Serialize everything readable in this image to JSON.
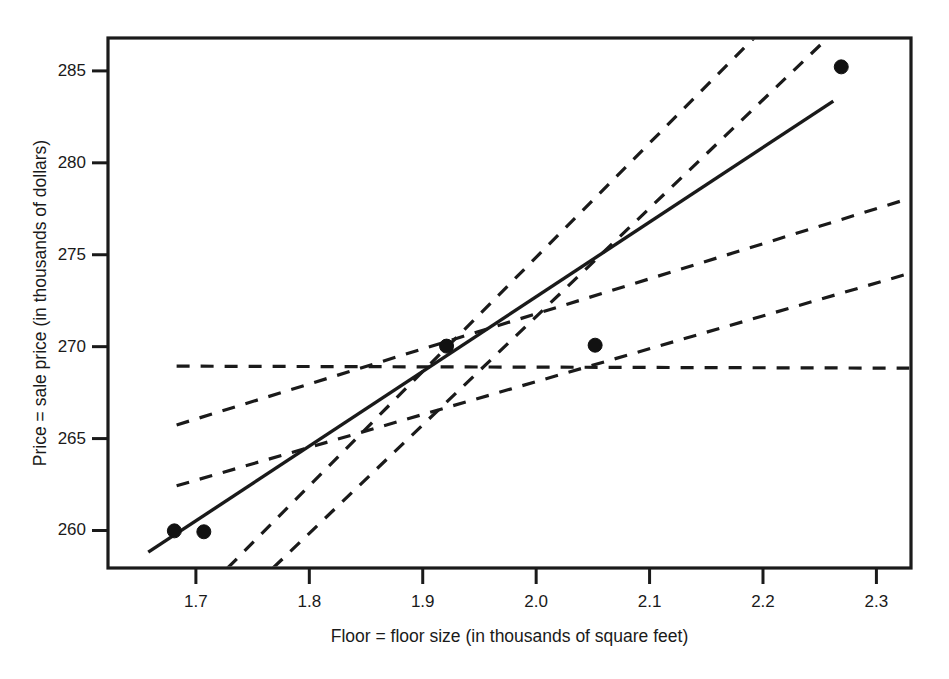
{
  "chart_data": {
    "type": "scatter",
    "title": "",
    "xlabel": "Floor = floor size (in thousands of square feet)",
    "ylabel": "Price = sale price (in thousands of dollars)",
    "xlim": [
      1.6225,
      2.3305
    ],
    "ylim": [
      257.96,
      286.79
    ],
    "xticks": [
      1.7,
      1.8,
      1.9,
      2.0,
      2.1,
      2.2,
      2.3
    ],
    "xtick_labels": [
      "1.7",
      "1.8",
      "1.9",
      "2.0",
      "2.1",
      "2.2",
      "2.3"
    ],
    "yticks": [
      260,
      265,
      270,
      275,
      280,
      285
    ],
    "ytick_labels": [
      "260",
      "265",
      "270",
      "275",
      "280",
      "285"
    ],
    "grid": false,
    "legend": "none",
    "points": [
      {
        "x": 1.681,
        "y": 259.98
      },
      {
        "x": 1.707,
        "y": 259.93
      },
      {
        "x": 1.921,
        "y": 270.03
      },
      {
        "x": 2.052,
        "y": 270.08
      },
      {
        "x": 2.269,
        "y": 285.22
      }
    ],
    "point_color": "#111111",
    "point_radius_px": 7,
    "fitted_line": {
      "name": "least squares regression line",
      "style": "solid",
      "color": "#1a1a1a",
      "x0": 1.658,
      "y0": 258.82,
      "x1": 2.262,
      "y1": 283.36,
      "slope": 40.63,
      "intercept": 191.45
    },
    "candidate_lines": [
      {
        "name": "horizontal candidate line",
        "style": "dashed",
        "color": "#1a1a1a",
        "x0": 1.683,
        "y0": 268.94,
        "x1": 2.33,
        "y1": 268.83,
        "slope": -0.17
      },
      {
        "name": "shallow positive candidate line",
        "style": "dashed",
        "color": "#1a1a1a",
        "x0": 1.683,
        "y0": 265.74,
        "x1": 2.33,
        "y1": 278.08,
        "slope": 19.07
      },
      {
        "name": "moderate positive candidate line",
        "style": "dashed",
        "color": "#1a1a1a",
        "x0": 1.683,
        "y0": 262.43,
        "x1": 2.33,
        "y1": 274.0,
        "slope": 17.88
      },
      {
        "name": "steep candidate line left",
        "style": "dashed",
        "color": "#1a1a1a",
        "x0": 1.728,
        "y0": 257.96,
        "x1": 2.192,
        "y1": 286.79,
        "slope": 62.14
      },
      {
        "name": "steepest candidate line right",
        "style": "dashed",
        "color": "#1a1a1a",
        "x0": 1.768,
        "y0": 257.96,
        "x1": 2.257,
        "y1": 286.79,
        "slope": 58.96
      }
    ],
    "convergence_point": {
      "x": 1.935,
      "y": 268.93
    },
    "axis_color": "#1a1a1a",
    "background": "#ffffff"
  }
}
